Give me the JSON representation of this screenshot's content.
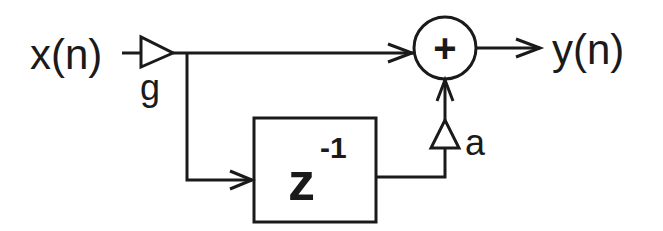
{
  "diagram": {
    "type": "signal-flow",
    "input_label": "x(n)",
    "output_label": "y(n)",
    "input_gain": {
      "label": "g",
      "shape": "triangle-amplifier"
    },
    "delay_block": {
      "base": "z",
      "exponent": "-1"
    },
    "feedforward_gain": {
      "label": "a",
      "shape": "triangle-amplifier"
    },
    "summer": {
      "symbol": "+"
    },
    "edges": [
      {
        "from": "x(n)",
        "to": "g"
      },
      {
        "from": "g",
        "to": "summer"
      },
      {
        "from": "g",
        "to": "delay_block"
      },
      {
        "from": "delay_block",
        "to": "a"
      },
      {
        "from": "a",
        "to": "summer"
      },
      {
        "from": "summer",
        "to": "y(n)"
      }
    ],
    "colors": {
      "stroke": "#1a1a1a",
      "background": "#ffffff"
    }
  }
}
